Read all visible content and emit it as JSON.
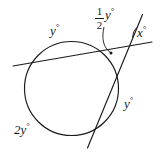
{
  "figure": {
    "stroke_color": "#1a1a1a",
    "background_color": "#ffffff",
    "labels": {
      "arc_top_left": "y",
      "arc_right": "y",
      "arc_bottom_left": "2y",
      "angle_exterior": "x",
      "angle_interior_numerator": "1",
      "angle_interior_denominator": "2",
      "angle_interior_variable": "y",
      "degree_symbol": "°"
    },
    "circle": {
      "center_x": 71.5,
      "center_y": 88.5,
      "radius": 47
    },
    "lines": [
      {
        "name": "secant-near-horizontal",
        "x1": 13,
        "y1": 66,
        "x2": 152,
        "y2": 42
      },
      {
        "name": "secant-steep",
        "x1": 142,
        "y1": 15,
        "x2": 88,
        "y2": 148
      }
    ]
  }
}
